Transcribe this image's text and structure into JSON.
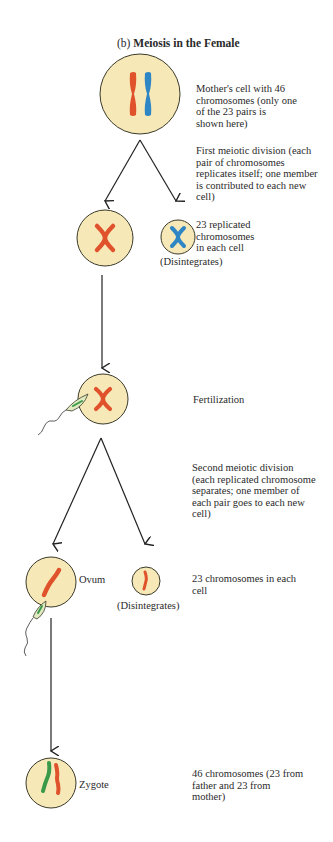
{
  "title": {
    "prefix": "(b)",
    "text": "Meiosis in the Female"
  },
  "colors": {
    "cell_fill": "#f7e8b8",
    "cell_stroke": "#3a3a2a",
    "maternal_chromosome": "#e0522c",
    "paternal_chromosome_blue": "#2f86c4",
    "sperm_green": "#3a9a4a",
    "sperm_fill": "#dfeac0",
    "arrow": "#222222"
  },
  "stages": [
    {
      "id": "mother-cell",
      "cell_label": "",
      "description": "Mother's cell with 46\nchromosomes (only one\nof the 23 pairs is\nshown here)"
    },
    {
      "id": "first-meiotic-division",
      "cell_label": "",
      "description": "First meiotic division (each\npair of chromosomes\nreplicates itself; one member\nis contributed to each new\ncell)"
    },
    {
      "id": "replicated",
      "cell_label": "(Disintegrates)",
      "description": "23 replicated\nchromosomes\nin each cell"
    },
    {
      "id": "fertilization",
      "cell_label": "",
      "description": "Fertilization"
    },
    {
      "id": "second-meiotic-division",
      "cell_label": "",
      "description": "Second meiotic division\n(each replicated chromosome\nseparates; one member of\neach pair goes to each new\ncell)"
    },
    {
      "id": "ovum",
      "cell_label": "Ovum",
      "secondary_label": "(Disintegrates)",
      "description": "23 chromosomes in each\ncell"
    },
    {
      "id": "zygote",
      "cell_label": "Zygote",
      "description": "46 chromosomes (23 from\nfather and 23 from\nmother)"
    }
  ]
}
